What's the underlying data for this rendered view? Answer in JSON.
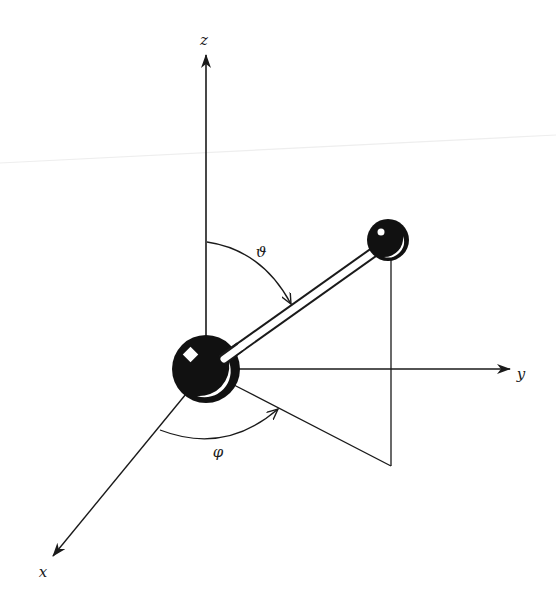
{
  "figure": {
    "type": "diatomic-molecule-spherical-coordinates",
    "colors": {
      "background": "#ffffff",
      "ink": "#1a1a1a",
      "scan_artifact": "#eeeeee"
    }
  },
  "axes": {
    "z": {
      "label": "z",
      "label_pos": [
        204,
        40
      ]
    },
    "y": {
      "label": "y",
      "label_pos": [
        521,
        374
      ]
    },
    "x": {
      "label": "x",
      "label_pos": [
        43,
        572
      ]
    }
  },
  "angles": {
    "theta": {
      "label": "ϑ",
      "label_pos": [
        261,
        252
      ]
    },
    "phi": {
      "label": "φ",
      "label_pos": [
        218,
        452
      ]
    }
  },
  "atoms": [
    {
      "name": "large-atom",
      "center": [
        206,
        369
      ],
      "radius": 34
    },
    {
      "name": "small-atom",
      "center": [
        388,
        240
      ],
      "radius": 21
    }
  ]
}
